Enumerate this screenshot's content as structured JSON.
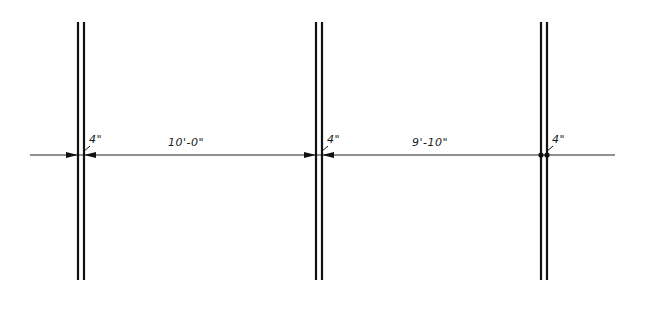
{
  "diagram": {
    "type": "architectural-wall-plan-dimension",
    "stroke_color": "#111111",
    "background": "#ffffff",
    "dimension_line": {
      "y": 155,
      "x_start": 30,
      "x_end": 615
    },
    "walls": [
      {
        "id": "wall-1",
        "x_left": 78,
        "x_right": 84,
        "y_top": 22,
        "y_bottom": 280,
        "thickness_label": "4\""
      },
      {
        "id": "wall-2",
        "x_left": 316,
        "x_right": 322,
        "y_top": 22,
        "y_bottom": 280,
        "thickness_label": "4\""
      },
      {
        "id": "wall-3",
        "x_left": 541,
        "x_right": 547,
        "y_top": 22,
        "y_bottom": 280,
        "thickness_label": "4\""
      }
    ],
    "spans": [
      {
        "id": "span-1",
        "label": "10'-0\"",
        "from_wall": "wall-1",
        "to_wall": "wall-2"
      },
      {
        "id": "span-2",
        "label": "9'-10\"",
        "from_wall": "wall-2",
        "to_wall": "wall-3"
      }
    ],
    "labels": {
      "wall1_thickness": "4\"",
      "wall2_thickness": "4\"",
      "wall3_thickness": "4\"",
      "span1": "10'-0\"",
      "span2": "9'-10\""
    }
  }
}
